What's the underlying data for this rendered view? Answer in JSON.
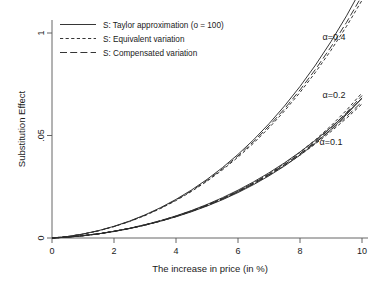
{
  "chart_data": {
    "type": "line",
    "title": "",
    "xlabel": "The increase in price (in %)",
    "ylabel": "Substitution Effect",
    "xlim": [
      0,
      10
    ],
    "ylim": [
      0,
      0.112
    ],
    "xticks": [
      0,
      2,
      4,
      6,
      8,
      10
    ],
    "xticklabels": [
      "0",
      "2",
      "4",
      "6",
      "8",
      "10"
    ],
    "yticks": [
      0,
      0.05,
      0.1
    ],
    "yticklabels": [
      "0",
      ".05",
      "1"
    ],
    "grid": false,
    "legend_position": "top-left",
    "legend": [
      "S: Taylor approximation (o = 100)",
      "S: Equivalent  variation",
      "S: Compensated variation"
    ],
    "annotations": [
      {
        "label": "α=0.4",
        "x": 9.1,
        "y": 0.0965
      },
      {
        "label": "α=0.2",
        "x": 9.1,
        "y": 0.0685
      },
      {
        "label": "α=0.1",
        "x": 9.0,
        "y": 0.0455
      }
    ],
    "x": [
      0,
      0.5,
      1,
      1.5,
      2,
      2.5,
      3,
      3.5,
      4,
      4.5,
      5,
      5.5,
      6,
      6.5,
      7,
      7.5,
      8,
      8.5,
      9,
      9.5,
      10
    ],
    "groups": [
      {
        "alpha": 0.4,
        "series": [
          {
            "name": "S: Taylor approximation (o = 100)",
            "style": "solid",
            "values": [
              0,
              0.00042,
              0.00112,
              0.00205,
              0.00322,
              0.00462,
              0.00628,
              0.00818,
              0.01035,
              0.01281,
              0.01558,
              0.01868,
              0.02215,
              0.02602,
              0.03032,
              0.03511,
              0.04043,
              0.04634,
              0.05292,
              0.06022,
              0.06835
            ]
          },
          {
            "name": "S: Equivalent  variation",
            "style": "short-dash",
            "values": [
              0,
              0.00044,
              0.00117,
              0.00213,
              0.00334,
              0.00479,
              0.0065,
              0.00847,
              0.01071,
              0.01325,
              0.01611,
              0.01931,
              0.0229,
              0.0269,
              0.03135,
              0.03631,
              0.04182,
              0.04795,
              0.05477,
              0.06235,
              0.0708
            ]
          },
          {
            "name": "S: Compensated variation",
            "style": "long-dash",
            "values": [
              0,
              0.00043,
              0.00114,
              0.00209,
              0.00328,
              0.00471,
              0.00639,
              0.00832,
              0.01052,
              0.01302,
              0.01583,
              0.01897,
              0.02249,
              0.02642,
              0.03079,
              0.03566,
              0.04107,
              0.04708,
              0.05377,
              0.0612,
              0.06948
            ]
          }
        ]
      },
      {
        "alpha": 0.2,
        "series": [
          {
            "name": "S: Taylor approximation (o = 100)",
            "style": "solid",
            "values": [
              0,
              0.00072,
              0.00195,
              0.0036,
              0.0057,
              0.00825,
              0.01128,
              0.0148,
              0.01884,
              0.02342,
              0.02858,
              0.03435,
              0.04077,
              0.04788,
              0.05574,
              0.0644,
              0.07392,
              0.08437,
              0.09582,
              0.10836,
              0.12208
            ]
          },
          {
            "name": "S: Equivalent  variation",
            "style": "short-dash",
            "values": [
              0,
              0.0007,
              0.0019,
              0.0035,
              0.00554,
              0.00801,
              0.01095,
              0.01436,
              0.01827,
              0.0227,
              0.02768,
              0.03324,
              0.03941,
              0.04623,
              0.05373,
              0.06197,
              0.07099,
              0.08084,
              0.09157,
              0.10325,
              0.11593
            ]
          },
          {
            "name": "S: Compensated variation",
            "style": "long-dash",
            "values": [
              0,
              0.00071,
              0.00192,
              0.00354,
              0.00561,
              0.00811,
              0.01108,
              0.01454,
              0.01851,
              0.02301,
              0.02808,
              0.03374,
              0.04002,
              0.04697,
              0.05462,
              0.06302,
              0.07222,
              0.08227,
              0.09323,
              0.10517,
              0.11815
            ]
          }
        ]
      },
      {
        "alpha": 0.1,
        "series": [
          {
            "name": "S: Taylor approximation (o = 100)",
            "style": "solid",
            "values": [
              0,
              0.00041,
              0.0011,
              0.00204,
              0.00324,
              0.0047,
              0.00644,
              0.00846,
              0.01078,
              0.01341,
              0.01637,
              0.01967,
              0.02333,
              0.02737,
              0.03181,
              0.03667,
              0.04196,
              0.04772,
              0.05396,
              0.06072,
              0.06802
            ]
          },
          {
            "name": "S: Equivalent  variation",
            "style": "short-dash",
            "values": [
              0,
              0.0004,
              0.00107,
              0.00198,
              0.00315,
              0.00457,
              0.00625,
              0.0082,
              0.01044,
              0.01298,
              0.01583,
              0.01901,
              0.02253,
              0.02641,
              0.03068,
              0.03534,
              0.04042,
              0.04594,
              0.05193,
              0.0584,
              0.06538
            ]
          },
          {
            "name": "S: Compensated variation",
            "style": "long-dash",
            "values": [
              0,
              0.0004,
              0.00108,
              0.002,
              0.00319,
              0.00462,
              0.00632,
              0.0083,
              0.01057,
              0.01314,
              0.01603,
              0.01926,
              0.02283,
              0.02677,
              0.0311,
              0.03584,
              0.041,
              0.04662,
              0.05271,
              0.0593,
              0.06641
            ]
          }
        ]
      }
    ]
  }
}
